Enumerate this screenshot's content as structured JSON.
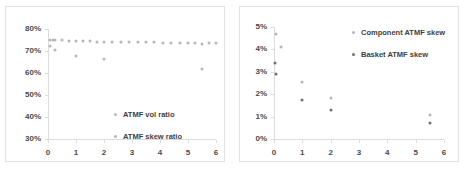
{
  "figure": {
    "background": "#ffffff",
    "panel_border_color": "#e2e2e2",
    "axis_color": "#dcdcdc"
  },
  "chart_data": [
    {
      "type": "scatter",
      "title": "",
      "xlabel": "",
      "ylabel": "",
      "xlim": [
        0,
        6
      ],
      "ylim": [
        0.3,
        0.8
      ],
      "xticks": [
        "0",
        "1",
        "2",
        "3",
        "4",
        "5",
        "6"
      ],
      "xtick_values": [
        0,
        1,
        2,
        3,
        4,
        5,
        6
      ],
      "yticks": [
        "30%",
        "40%",
        "50%",
        "60%",
        "70%",
        "80%"
      ],
      "ytick_values": [
        0.3,
        0.4,
        0.5,
        0.6,
        0.7,
        0.8
      ],
      "grid": false,
      "legend_position": "center-right",
      "colors": {
        "series0": "#b7b7b7",
        "series1": "#6f6f6f"
      },
      "series": [
        {
          "name": "ATMF vol ratio",
          "color": "#b7b7b7",
          "points": [
            {
              "x": 0.08,
              "y": 0.75
            },
            {
              "x": 0.17,
              "y": 0.752
            },
            {
              "x": 0.25,
              "y": 0.751
            },
            {
              "x": 0.5,
              "y": 0.748
            },
            {
              "x": 0.75,
              "y": 0.747
            },
            {
              "x": 1.0,
              "y": 0.746
            },
            {
              "x": 1.25,
              "y": 0.745
            },
            {
              "x": 1.5,
              "y": 0.744
            },
            {
              "x": 1.75,
              "y": 0.743
            },
            {
              "x": 2.0,
              "y": 0.742
            },
            {
              "x": 2.3,
              "y": 0.741
            },
            {
              "x": 2.6,
              "y": 0.741
            },
            {
              "x": 2.9,
              "y": 0.74
            },
            {
              "x": 3.2,
              "y": 0.74
            },
            {
              "x": 3.5,
              "y": 0.739
            },
            {
              "x": 3.8,
              "y": 0.739
            },
            {
              "x": 4.1,
              "y": 0.738
            },
            {
              "x": 4.4,
              "y": 0.738
            },
            {
              "x": 4.7,
              "y": 0.737
            },
            {
              "x": 5.0,
              "y": 0.737
            },
            {
              "x": 5.25,
              "y": 0.736
            },
            {
              "x": 5.5,
              "y": 0.733
            },
            {
              "x": 5.75,
              "y": 0.736
            },
            {
              "x": 6.0,
              "y": 0.736
            }
          ]
        },
        {
          "name": "ATMF skew ratio",
          "color": "#b7b7b7",
          "points": [
            {
              "x": 0.08,
              "y": 0.722
            },
            {
              "x": 0.25,
              "y": 0.706
            },
            {
              "x": 1.0,
              "y": 0.678
            },
            {
              "x": 2.0,
              "y": 0.662
            },
            {
              "x": 5.5,
              "y": 0.617
            }
          ]
        }
      ],
      "legend": [
        {
          "label": "ATMF vol ratio",
          "color": "#b7b7b7"
        },
        {
          "label": "ATMF skew ratio",
          "color": "#b7b7b7"
        }
      ]
    },
    {
      "type": "scatter",
      "title": "",
      "xlabel": "",
      "ylabel": "",
      "xlim": [
        0,
        6
      ],
      "ylim": [
        0.0,
        0.05
      ],
      "xticks": [
        "0",
        "1",
        "2",
        "3",
        "4",
        "5",
        "6"
      ],
      "xtick_values": [
        0,
        1,
        2,
        3,
        4,
        5,
        6
      ],
      "yticks": [
        "0%",
        "1%",
        "2%",
        "3%",
        "4%",
        "5%"
      ],
      "ytick_values": [
        0.0,
        0.01,
        0.02,
        0.03,
        0.04,
        0.05
      ],
      "grid": false,
      "legend_position": "top-right",
      "colors": {
        "series0": "#b7b7b7",
        "series1": "#6f6f6f"
      },
      "series": [
        {
          "name": "Component ATMF skew",
          "color": "#b7b7b7",
          "points": [
            {
              "x": 0.08,
              "y": 0.0468
            },
            {
              "x": 0.25,
              "y": 0.041
            },
            {
              "x": 1.0,
              "y": 0.0255
            },
            {
              "x": 2.0,
              "y": 0.0182
            },
            {
              "x": 5.5,
              "y": 0.0108
            }
          ]
        },
        {
          "name": "Basket ATMF skew",
          "color": "#6f6f6f",
          "points": [
            {
              "x": 0.02,
              "y": 0.0338
            },
            {
              "x": 0.08,
              "y": 0.0292
            },
            {
              "x": 1.0,
              "y": 0.0175
            },
            {
              "x": 2.0,
              "y": 0.0128
            },
            {
              "x": 5.5,
              "y": 0.007
            }
          ]
        }
      ],
      "legend": [
        {
          "label": "Component ATMF skew",
          "color": "#b7b7b7"
        },
        {
          "label": "Basket ATMF skew",
          "color": "#6f6f6f"
        }
      ]
    }
  ]
}
